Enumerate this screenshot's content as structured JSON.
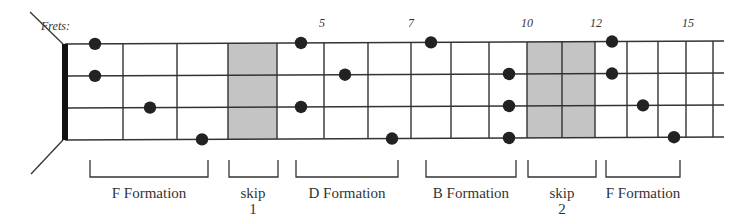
{
  "diagram": {
    "title_label": "Frets:",
    "colors": {
      "line": "#333333",
      "nut": "#111111",
      "shade": "#c4c4c4",
      "dot": "#222222",
      "text": "#333333"
    },
    "nut_x": 65,
    "string_end_x": 724,
    "strings_y_left": [
      44,
      76,
      108,
      140
    ],
    "strings_y_right": [
      41,
      73,
      105,
      137
    ],
    "fret_lines_x": [
      123,
      177,
      228,
      277,
      324,
      368,
      411,
      451,
      489,
      527,
      562,
      595,
      627,
      658,
      686,
      713
    ],
    "shaded_regions": [
      {
        "name": "skip-1",
        "x1": 228,
        "x2": 277
      },
      {
        "name": "skip-2",
        "x1": 527,
        "x2": 595
      }
    ],
    "fret_numbers": [
      {
        "label": "5",
        "x": 322
      },
      {
        "label": "7",
        "x": 411
      },
      {
        "label": "10",
        "x": 527
      },
      {
        "label": "12",
        "x": 596
      },
      {
        "label": "15",
        "x": 688
      }
    ],
    "dots": [
      {
        "x": 95,
        "string": 0
      },
      {
        "x": 95,
        "string": 1
      },
      {
        "x": 150,
        "string": 2
      },
      {
        "x": 202,
        "string": 3
      },
      {
        "x": 301,
        "string": 0
      },
      {
        "x": 345,
        "string": 1
      },
      {
        "x": 301,
        "string": 2
      },
      {
        "x": 392,
        "string": 3
      },
      {
        "x": 431,
        "string": 0
      },
      {
        "x": 509,
        "string": 1
      },
      {
        "x": 509,
        "string": 2
      },
      {
        "x": 509,
        "string": 3
      },
      {
        "x": 612,
        "string": 0
      },
      {
        "x": 612,
        "string": 1
      },
      {
        "x": 643,
        "string": 2
      },
      {
        "x": 674,
        "string": 3
      }
    ],
    "brackets": [
      {
        "label": "F Formation",
        "x1": 90,
        "x2": 208,
        "label_x": 149,
        "sub": ""
      },
      {
        "label": "skip",
        "x1": 229,
        "x2": 278,
        "label_x": 253,
        "sub": "1"
      },
      {
        "label": "D Formation",
        "x1": 296,
        "x2": 398,
        "label_x": 347,
        "sub": ""
      },
      {
        "label": "B Formation",
        "x1": 426,
        "x2": 516,
        "label_x": 471,
        "sub": ""
      },
      {
        "label": "skip",
        "x1": 528,
        "x2": 596,
        "label_x": 562,
        "sub": "2"
      },
      {
        "label": "F Formation",
        "x1": 606,
        "x2": 680,
        "label_x": 643,
        "sub": ""
      }
    ]
  }
}
